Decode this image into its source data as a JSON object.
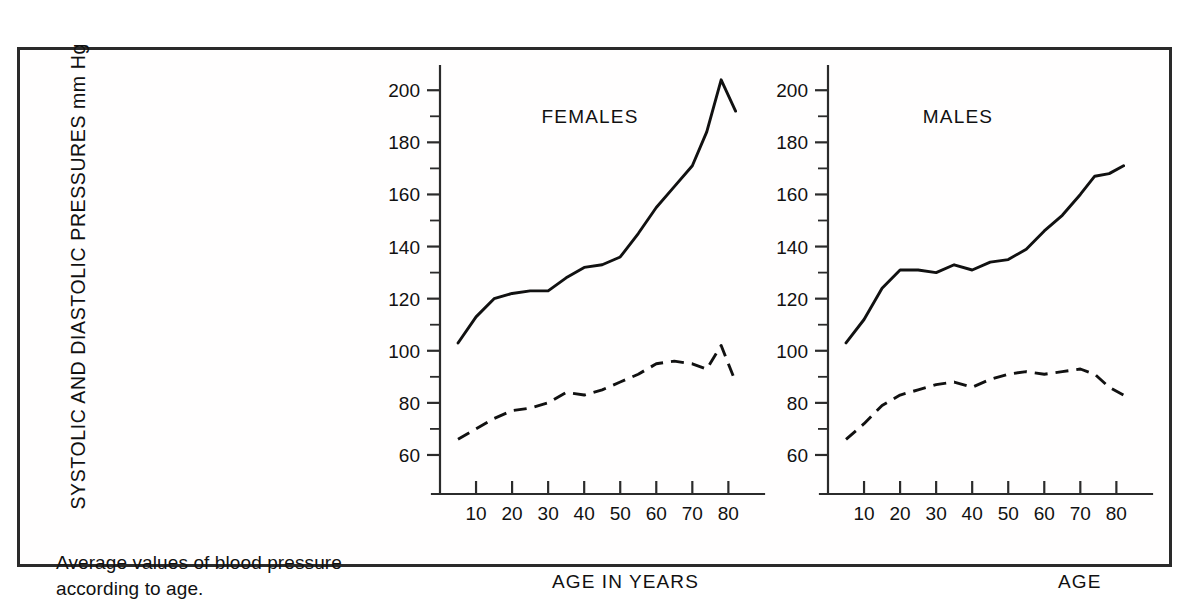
{
  "caption": "Average values of blood pressure according to age.",
  "axes": {
    "ylabel": "SYSTOLIC AND DIASTOLIC PRESSURES mm Hg",
    "yticks": [
      60,
      80,
      100,
      120,
      140,
      160,
      180,
      200
    ],
    "yminor_step": 10,
    "ylim": [
      55,
      207
    ],
    "xticks": [
      10,
      20,
      30,
      40,
      50,
      60,
      70,
      80
    ],
    "xlim": [
      0,
      86
    ]
  },
  "panels": [
    {
      "id": "females",
      "title": "FEMALES",
      "xlabel": "AGE IN YEARS"
    },
    {
      "id": "males",
      "title": "MALES",
      "xlabel": "AGE"
    }
  ],
  "chart_data": {
    "type": "line",
    "title": "Average values of blood pressure according to age.",
    "xlabel": "AGE IN YEARS",
    "ylabel": "SYSTOLIC AND DIASTOLIC PRESSURES mm Hg",
    "xlim": [
      0,
      86
    ],
    "ylim": [
      55,
      207
    ],
    "yticks": [
      60,
      80,
      100,
      120,
      140,
      160,
      180,
      200
    ],
    "xticks": [
      10,
      20,
      30,
      40,
      50,
      60,
      70,
      80
    ],
    "grid": false,
    "legend": "none",
    "panels": [
      {
        "name": "FEMALES",
        "xlabel": "AGE IN YEARS",
        "series": [
          {
            "name": "Systolic",
            "style": "solid",
            "x": [
              5,
              10,
              15,
              20,
              25,
              30,
              35,
              40,
              45,
              50,
              55,
              60,
              65,
              70,
              74,
              78,
              82
            ],
            "values": [
              103,
              113,
              120,
              122,
              123,
              123,
              128,
              132,
              133,
              136,
              145,
              155,
              163,
              171,
              184,
              204,
              192
            ]
          },
          {
            "name": "Diastolic",
            "style": "dashed",
            "x": [
              5,
              10,
              15,
              20,
              25,
              30,
              35,
              40,
              45,
              50,
              55,
              60,
              65,
              70,
              74,
              78,
              82
            ],
            "values": [
              66,
              70,
              74,
              77,
              78,
              80,
              84,
              83,
              85,
              88,
              91,
              95,
              96,
              95,
              93,
              102,
              88
            ]
          }
        ]
      },
      {
        "name": "MALES",
        "xlabel": "AGE",
        "series": [
          {
            "name": "Systolic",
            "style": "solid",
            "x": [
              5,
              10,
              15,
              20,
              25,
              30,
              35,
              40,
              45,
              50,
              55,
              60,
              65,
              70,
              74,
              78,
              82
            ],
            "values": [
              103,
              112,
              124,
              131,
              131,
              130,
              133,
              131,
              134,
              135,
              139,
              146,
              152,
              160,
              167,
              168,
              171
            ]
          },
          {
            "name": "Diastolic",
            "style": "dashed",
            "x": [
              5,
              10,
              15,
              20,
              25,
              30,
              35,
              40,
              45,
              50,
              55,
              60,
              65,
              70,
              74,
              78,
              82
            ],
            "values": [
              66,
              72,
              79,
              83,
              85,
              87,
              88,
              86,
              89,
              91,
              92,
              91,
              92,
              93,
              91,
              86,
              83
            ]
          }
        ]
      }
    ]
  }
}
